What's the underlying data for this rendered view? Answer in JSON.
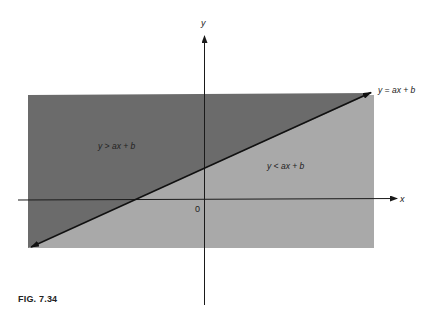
{
  "figure": {
    "caption": "FIG. 7.34",
    "axes": {
      "x_label": "x",
      "y_label": "y",
      "origin_label": "0"
    },
    "line_label": "y = ax + b",
    "regions": {
      "above": {
        "label": "y > ax + b",
        "color": "#6b6b6b"
      },
      "below": {
        "label": "y < ax + b",
        "color": "#a9a9a9"
      }
    },
    "colors": {
      "axis": "#1a1a1a",
      "line": "#111111",
      "background": "#ffffff"
    }
  }
}
